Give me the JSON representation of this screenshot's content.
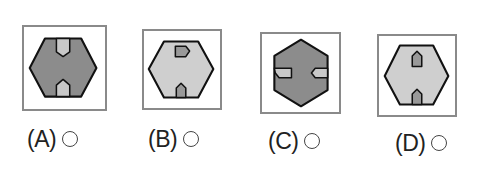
{
  "colors": {
    "dark_fill": "#8c8c8c",
    "light_fill": "#cfcfcf",
    "notch_light": "#c8c8c8",
    "notch_dark": "#999999",
    "outline": "#111111",
    "frame": "#8a8a8a"
  },
  "options": [
    {
      "id": "A",
      "label": "(A)",
      "hexagon": "flat-top, dark gray",
      "notches": [
        "top: shield pointing down",
        "bottom: house pointing up"
      ]
    },
    {
      "id": "B",
      "label": "(B)",
      "hexagon": "flat-top, light gray",
      "notches": [
        "top: tab pointing right",
        "bottom: house pointing up"
      ]
    },
    {
      "id": "C",
      "label": "(C)",
      "hexagon": "pointy-top, dark gray",
      "notches": [
        "left: tab pointing left",
        "right: notch pointing left"
      ]
    },
    {
      "id": "D",
      "label": "(D)",
      "hexagon": "flat-top, light gray",
      "notches": [
        "top: house pointing up",
        "bottom: house pointing up"
      ]
    }
  ]
}
